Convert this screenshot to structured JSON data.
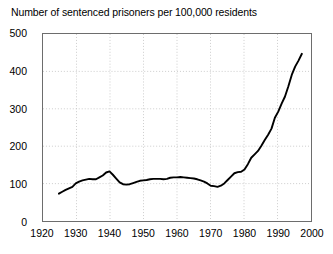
{
  "chart_data": {
    "type": "line",
    "title": "Number of sentenced prisoners per 100,000 residents",
    "xlabel": "",
    "ylabel": "",
    "xlim": [
      1920,
      2000
    ],
    "ylim": [
      0,
      500
    ],
    "xticks": [
      1920,
      1930,
      1940,
      1950,
      1960,
      1970,
      1980,
      1990,
      2000
    ],
    "yticks": [
      0,
      100,
      200,
      300,
      400,
      500
    ],
    "grid": true,
    "legend": "none",
    "line_color": "#000000",
    "series": [
      {
        "name": "Sentenced prisoners per 100,000 residents",
        "x": [
          1925,
          1926,
          1927,
          1928,
          1929,
          1930,
          1931,
          1932,
          1933,
          1934,
          1935,
          1936,
          1937,
          1938,
          1939,
          1940,
          1941,
          1942,
          1943,
          1944,
          1945,
          1946,
          1947,
          1948,
          1949,
          1950,
          1951,
          1952,
          1953,
          1954,
          1955,
          1956,
          1957,
          1958,
          1959,
          1960,
          1961,
          1962,
          1963,
          1964,
          1965,
          1966,
          1967,
          1968,
          1969,
          1970,
          1971,
          1972,
          1973,
          1974,
          1975,
          1976,
          1977,
          1978,
          1979,
          1980,
          1981,
          1982,
          1983,
          1984,
          1985,
          1986,
          1987,
          1988,
          1989,
          1990,
          1991,
          1992,
          1993,
          1994,
          1995,
          1996,
          1997
        ],
        "y": [
          75,
          80,
          85,
          89,
          93,
          102,
          107,
          110,
          112,
          114,
          113,
          113,
          118,
          123,
          131,
          134,
          125,
          115,
          105,
          100,
          99,
          100,
          103,
          106,
          109,
          110,
          111,
          113,
          114,
          114,
          114,
          113,
          114,
          117,
          118,
          118,
          119,
          118,
          117,
          116,
          115,
          113,
          110,
          107,
          102,
          96,
          95,
          93,
          96,
          102,
          111,
          120,
          129,
          132,
          133,
          139,
          153,
          170,
          179,
          188,
          202,
          217,
          231,
          247,
          276,
          292,
          313,
          332,
          359,
          389,
          411,
          427,
          445
        ]
      }
    ]
  }
}
